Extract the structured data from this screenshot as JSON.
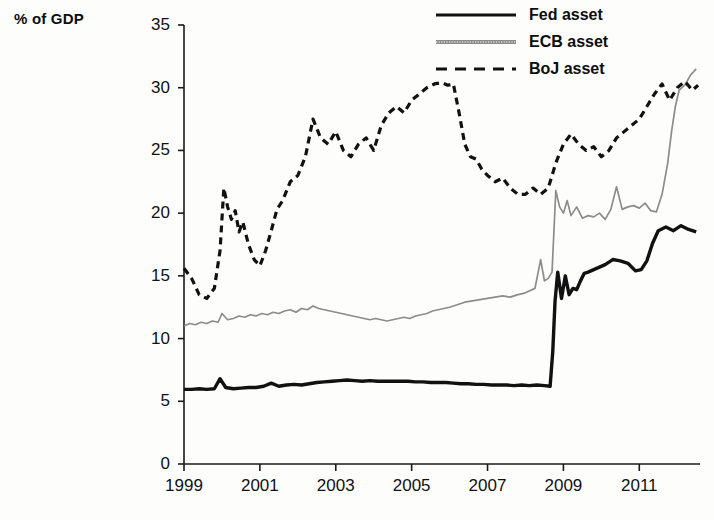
{
  "axis_title": "% of GDP",
  "legend": {
    "items": [
      {
        "label": "Fed asset",
        "style": "solid",
        "color": "#111111"
      },
      {
        "label": "ECB asset",
        "style": "solid-gray",
        "color": "#8c8c8c"
      },
      {
        "label": "BoJ asset",
        "style": "dashed",
        "color": "#111111"
      }
    ]
  },
  "axes": {
    "y_ticks": [
      "0",
      "5",
      "10",
      "15",
      "20",
      "25",
      "30",
      "35"
    ],
    "x_ticks": [
      "1999",
      "2001",
      "2003",
      "2005",
      "2007",
      "2009",
      "2011"
    ]
  },
  "chart_data": {
    "type": "line",
    "title": "",
    "xlabel": "",
    "ylabel": "% of GDP",
    "xlim": [
      1999,
      2012.6
    ],
    "ylim": [
      0,
      35
    ],
    "grid": false,
    "legend_position": "top-right",
    "x_tick_values": [
      1999,
      2001,
      2003,
      2005,
      2007,
      2009,
      2011
    ],
    "y_tick_values": [
      0,
      5,
      10,
      15,
      20,
      25,
      30,
      35
    ],
    "series": [
      {
        "name": "Fed asset",
        "style": "solid",
        "color": "#111111",
        "x": [
          1999.0,
          1999.2,
          1999.4,
          1999.6,
          1999.8,
          1999.95,
          2000.1,
          2000.3,
          2000.5,
          2000.7,
          2000.9,
          2001.1,
          2001.3,
          2001.5,
          2001.7,
          2001.9,
          2002.1,
          2002.3,
          2002.5,
          2002.7,
          2002.9,
          2003.1,
          2003.3,
          2003.5,
          2003.7,
          2003.9,
          2004.1,
          2004.3,
          2004.5,
          2004.7,
          2004.9,
          2005.1,
          2005.3,
          2005.5,
          2005.7,
          2005.9,
          2006.1,
          2006.3,
          2006.5,
          2006.7,
          2006.9,
          2007.1,
          2007.3,
          2007.5,
          2007.7,
          2007.9,
          2008.1,
          2008.3,
          2008.5,
          2008.65,
          2008.72,
          2008.78,
          2008.85,
          2008.95,
          2009.05,
          2009.15,
          2009.25,
          2009.35,
          2009.45,
          2009.55,
          2009.65,
          2009.8,
          2009.95,
          2010.1,
          2010.3,
          2010.5,
          2010.7,
          2010.9,
          2011.05,
          2011.2,
          2011.35,
          2011.5,
          2011.7,
          2011.9,
          2012.1,
          2012.3,
          2012.5
        ],
        "y": [
          5.95,
          5.95,
          6.0,
          5.95,
          6.0,
          6.8,
          6.1,
          6.0,
          6.05,
          6.1,
          6.1,
          6.2,
          6.45,
          6.2,
          6.3,
          6.35,
          6.3,
          6.4,
          6.5,
          6.55,
          6.6,
          6.65,
          6.7,
          6.65,
          6.6,
          6.65,
          6.6,
          6.6,
          6.6,
          6.6,
          6.6,
          6.55,
          6.55,
          6.5,
          6.5,
          6.5,
          6.45,
          6.4,
          6.4,
          6.35,
          6.35,
          6.3,
          6.3,
          6.3,
          6.25,
          6.3,
          6.25,
          6.3,
          6.25,
          6.2,
          9.0,
          13.0,
          15.3,
          13.2,
          15.0,
          13.5,
          14.0,
          13.9,
          14.6,
          15.2,
          15.3,
          15.5,
          15.7,
          15.9,
          16.3,
          16.2,
          16.0,
          15.4,
          15.5,
          16.2,
          17.6,
          18.6,
          18.9,
          18.6,
          19.0,
          18.7,
          18.5
        ],
        "notes": "Sharp jump from ~6% to ~15% in late 2008 (Lehman/QE1); plateau ~18.5-19% by 2012"
      },
      {
        "name": "ECB asset",
        "style": "solid-gray",
        "color": "#8c8c8c",
        "x": [
          1999.0,
          1999.15,
          1999.3,
          1999.45,
          1999.6,
          1999.75,
          1999.9,
          2000.0,
          2000.15,
          2000.3,
          2000.45,
          2000.6,
          2000.75,
          2000.9,
          2001.05,
          2001.2,
          2001.35,
          2001.5,
          2001.65,
          2001.8,
          2001.95,
          2002.1,
          2002.25,
          2002.4,
          2002.55,
          2002.7,
          2002.85,
          2003.0,
          2003.15,
          2003.3,
          2003.45,
          2003.6,
          2003.75,
          2003.9,
          2004.05,
          2004.2,
          2004.35,
          2004.5,
          2004.65,
          2004.8,
          2004.95,
          2005.1,
          2005.25,
          2005.4,
          2005.55,
          2005.7,
          2005.85,
          2006.0,
          2006.2,
          2006.4,
          2006.6,
          2006.8,
          2007.0,
          2007.2,
          2007.4,
          2007.6,
          2007.8,
          2007.95,
          2008.1,
          2008.25,
          2008.4,
          2008.5,
          2008.6,
          2008.7,
          2008.8,
          2008.9,
          2009.0,
          2009.1,
          2009.2,
          2009.35,
          2009.5,
          2009.65,
          2009.8,
          2009.95,
          2010.1,
          2010.25,
          2010.4,
          2010.55,
          2010.7,
          2010.85,
          2011.0,
          2011.15,
          2011.3,
          2011.45,
          2011.6,
          2011.75,
          2011.85,
          2011.95,
          2012.05,
          2012.2,
          2012.35,
          2012.5
        ],
        "y": [
          11.0,
          11.2,
          11.1,
          11.3,
          11.2,
          11.4,
          11.3,
          12.0,
          11.5,
          11.6,
          11.8,
          11.7,
          11.9,
          11.8,
          12.0,
          11.9,
          12.1,
          12.0,
          12.2,
          12.3,
          12.1,
          12.4,
          12.3,
          12.6,
          12.4,
          12.3,
          12.2,
          12.1,
          12.0,
          11.9,
          11.8,
          11.7,
          11.6,
          11.5,
          11.6,
          11.5,
          11.4,
          11.5,
          11.6,
          11.7,
          11.6,
          11.8,
          11.9,
          12.0,
          12.2,
          12.3,
          12.4,
          12.5,
          12.7,
          12.9,
          13.0,
          13.1,
          13.2,
          13.3,
          13.4,
          13.3,
          13.5,
          13.6,
          13.8,
          14.0,
          16.3,
          14.6,
          14.8,
          15.3,
          21.8,
          20.5,
          20.0,
          21.0,
          19.8,
          20.5,
          19.6,
          19.8,
          19.7,
          20.0,
          19.5,
          20.3,
          22.1,
          20.3,
          20.5,
          20.6,
          20.4,
          20.8,
          20.2,
          20.1,
          21.5,
          24.0,
          26.5,
          28.5,
          29.8,
          30.2,
          31.0,
          31.5
        ],
        "notes": "Flat ~11-13% until 2008; spike to ~22% late 2008, then surge to ~31.5% in 2012 (LTRO)"
      },
      {
        "name": "BoJ asset",
        "style": "dashed",
        "color": "#111111",
        "x": [
          1999.0,
          1999.2,
          1999.4,
          1999.6,
          1999.8,
          1999.95,
          2000.05,
          2000.15,
          2000.25,
          2000.35,
          2000.45,
          2000.55,
          2000.7,
          2000.85,
          2001.0,
          2001.15,
          2001.3,
          2001.45,
          2001.6,
          2001.8,
          2002.0,
          2002.2,
          2002.4,
          2002.6,
          2002.8,
          2003.0,
          2003.2,
          2003.4,
          2003.6,
          2003.8,
          2004.0,
          2004.2,
          2004.4,
          2004.6,
          2004.8,
          2005.0,
          2005.2,
          2005.4,
          2005.6,
          2005.8,
          2005.95,
          2006.1,
          2006.25,
          2006.4,
          2006.55,
          2006.7,
          2006.85,
          2007.0,
          2007.2,
          2007.4,
          2007.6,
          2007.8,
          2008.0,
          2008.2,
          2008.4,
          2008.6,
          2008.8,
          2009.0,
          2009.2,
          2009.4,
          2009.6,
          2009.8,
          2010.0,
          2010.2,
          2010.4,
          2010.6,
          2010.8,
          2011.0,
          2011.2,
          2011.4,
          2011.6,
          2011.8,
          2012.0,
          2012.2,
          2012.4,
          2012.55
        ],
        "y": [
          15.6,
          14.8,
          13.5,
          13.2,
          14.0,
          17.0,
          22.0,
          20.5,
          19.5,
          20.2,
          18.5,
          19.3,
          17.5,
          16.3,
          15.8,
          17.0,
          18.6,
          20.3,
          21.0,
          22.5,
          23.0,
          24.5,
          27.5,
          26.0,
          25.5,
          26.5,
          25.0,
          24.5,
          25.5,
          26.0,
          25.0,
          27.0,
          28.0,
          28.5,
          28.0,
          29.0,
          29.5,
          30.0,
          30.3,
          30.4,
          30.2,
          30.3,
          28.0,
          25.5,
          24.5,
          24.3,
          23.5,
          23.0,
          22.5,
          22.8,
          22.0,
          21.5,
          21.5,
          22.0,
          21.5,
          22.0,
          24.0,
          25.5,
          26.3,
          25.5,
          25.0,
          25.3,
          24.5,
          25.0,
          26.0,
          26.5,
          27.0,
          27.5,
          28.5,
          29.5,
          30.3,
          29.0,
          30.0,
          30.5,
          29.8,
          30.2
        ],
        "notes": "Rises from ~15% to a ~30.4% peak in 2006 (QE era), falls to ~21.5%, then climbs back toward ~30% by 2012"
      }
    ]
  }
}
